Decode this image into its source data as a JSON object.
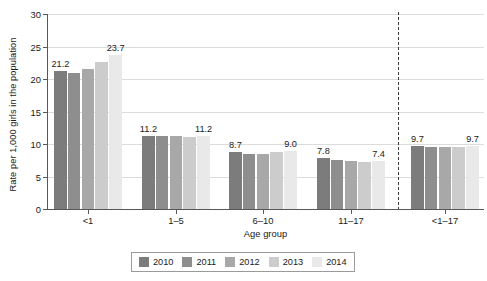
{
  "chart_data": {
    "type": "bar",
    "title": "",
    "xlabel": "Age group",
    "ylabel": "Rate per 1,000 girls in the population",
    "ylim": [
      0,
      30
    ],
    "yticks": [
      0,
      5,
      10,
      15,
      20,
      25,
      30
    ],
    "ytick_labels": [
      "0",
      "5",
      "10",
      "15",
      "20",
      "25",
      "30"
    ],
    "grid": true,
    "legend_position": "bottom",
    "categories": [
      "<1",
      "1–5",
      "6–10",
      "11–17",
      "<1–17"
    ],
    "series": [
      {
        "name": "2010",
        "color": "#7c7c7c",
        "values": [
          21.2,
          11.2,
          8.7,
          7.8,
          9.7
        ]
      },
      {
        "name": "2011",
        "color": "#8e8e8e",
        "values": [
          20.9,
          11.2,
          8.4,
          7.5,
          9.6
        ]
      },
      {
        "name": "2012",
        "color": "#a8a8a8",
        "values": [
          21.5,
          11.2,
          8.5,
          7.4,
          9.6
        ]
      },
      {
        "name": "2013",
        "color": "#cccccc",
        "values": [
          22.6,
          11.1,
          8.7,
          7.2,
          9.6
        ]
      },
      {
        "name": "2014",
        "color": "#e9e9e9",
        "values": [
          23.7,
          11.2,
          9.0,
          7.4,
          9.7
        ]
      }
    ],
    "annotations": [
      {
        "group": "<1",
        "series": "2010",
        "text": "21.2"
      },
      {
        "group": "<1",
        "series": "2014",
        "text": "23.7"
      },
      {
        "group": "1–5",
        "series": "2010",
        "text": "11.2"
      },
      {
        "group": "1–5",
        "series": "2014",
        "text": "11.2"
      },
      {
        "group": "6–10",
        "series": "2010",
        "text": "8.7"
      },
      {
        "group": "6–10",
        "series": "2014",
        "text": "9.0"
      },
      {
        "group": "11–17",
        "series": "2010",
        "text": "7.8"
      },
      {
        "group": "11–17",
        "series": "2014",
        "text": "7.4"
      },
      {
        "group": "<1–17",
        "series": "2010",
        "text": "9.7"
      },
      {
        "group": "<1–17",
        "series": "2014",
        "text": "9.7"
      }
    ],
    "divider": {
      "after_category": "11–17",
      "style": "dashed",
      "color": "#3a3a3a"
    }
  },
  "legend": {
    "items": [
      {
        "label": "2010",
        "color": "#7c7c7c"
      },
      {
        "label": "2011",
        "color": "#8e8e8e"
      },
      {
        "label": "2012",
        "color": "#a8a8a8"
      },
      {
        "label": "2013",
        "color": "#cccccc"
      },
      {
        "label": "2014",
        "color": "#e9e9e9"
      }
    ]
  },
  "colors": {
    "axis": "#58585a",
    "grid": "#dcdcdc",
    "text": "#1a1a1a",
    "background": "#ffffff"
  }
}
